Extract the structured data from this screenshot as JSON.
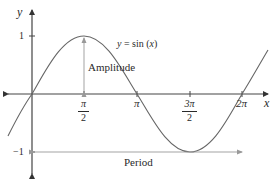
{
  "diagram": {
    "axes": {
      "x_label": "x",
      "y_label": "y",
      "y_ticks": [
        {
          "label": "1",
          "value": 1
        },
        {
          "label": "-1",
          "value": -1
        }
      ],
      "x_ticks": [
        {
          "numerator": "π",
          "denominator": "2",
          "value": "π/2"
        },
        {
          "label": "π",
          "value": "π"
        },
        {
          "numerator": "3π",
          "denominator": "2",
          "value": "3π/2"
        },
        {
          "label": "2π",
          "value": "2π"
        }
      ]
    },
    "curve": {
      "equation": "y = sin (x)",
      "equation_parts": {
        "y": "y",
        "eq": " = sin (",
        "x": "x",
        "close": ")"
      }
    },
    "annotations": {
      "amplitude": "Amplitude",
      "period": "Period"
    },
    "colors": {
      "axis": "#333333",
      "curve": "#555555",
      "annotation_line": "#888888",
      "text": "#2a2a2a"
    }
  }
}
